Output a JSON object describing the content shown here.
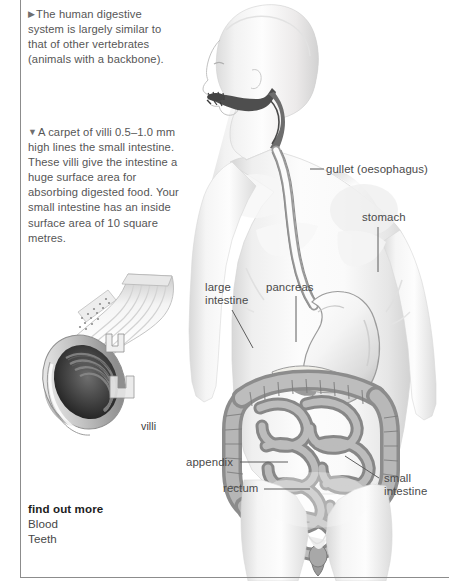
{
  "page": {
    "title": "Digestive system",
    "background_color": "#ffffff",
    "rule_color": "#8c8c8c",
    "body_text_color": "#565656",
    "label_text_color": "#4a4a4a"
  },
  "captions": {
    "intro": {
      "marker": "▶",
      "text": "The human digestive system is largely similar to that of other vertebrates (animals with a backbone)."
    },
    "villi": {
      "marker": "▼",
      "text": "A carpet of villi 0.5–1.0 mm high lines the small intestine. These villi give the intestine a huge surface area for absorbing digested food. Your small intestine has an inside surface area of 10 square metres."
    }
  },
  "find_out_more": {
    "title": "find out more",
    "links": [
      "Blood",
      "Teeth"
    ]
  },
  "anatomy_labels": [
    {
      "id": "gullet",
      "text": "gullet (oesophagus)"
    },
    {
      "id": "stomach",
      "text": "stomach"
    },
    {
      "id": "pancreas",
      "text": "pancreas"
    },
    {
      "id": "large_intestine",
      "text": "large\nintestine"
    },
    {
      "id": "appendix",
      "text": "appendix"
    },
    {
      "id": "rectum",
      "text": "rectum"
    },
    {
      "id": "small_intestine",
      "text": "small\nintestine"
    },
    {
      "id": "villi",
      "text": "villi"
    }
  ],
  "label_text": {
    "gullet": "gullet (oesophagus)",
    "stomach": "stomach",
    "pancreas": "pancreas",
    "large_intestine_l1": "large",
    "large_intestine_l2": "intestine",
    "appendix": "appendix",
    "rectum": "rectum",
    "small_intestine_l1": "small",
    "small_intestine_l2": "intestine",
    "villi": "villi"
  },
  "illustrations": {
    "human_figure": "grayscale-human-torso-digestive-system",
    "villi_inset": "intestine-cutaway-with-villi-magnification"
  }
}
